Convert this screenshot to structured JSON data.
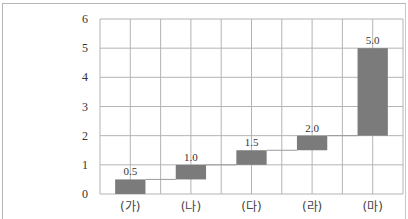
{
  "chart_data": {
    "type": "bar",
    "subtype": "waterfall",
    "title": "",
    "xlabel": "",
    "ylabel": "",
    "categories": [
      "(가)",
      "(나)",
      "(다)",
      "(라)",
      "(마)"
    ],
    "values": [
      0.5,
      1.0,
      1.5,
      2.0,
      5.0
    ],
    "bar_bottoms": [
      0,
      0.5,
      1.0,
      1.5,
      2.0
    ],
    "value_labels": [
      "0.5",
      "1.0",
      "1.5",
      "2.0",
      "5.0"
    ],
    "ylim": [
      0,
      6
    ],
    "yticks": [
      0,
      1,
      2,
      3,
      4,
      5,
      6
    ],
    "grid": true,
    "legend": null,
    "colors": {
      "bar": "#7b7b7b",
      "grid": "#b4b4b4",
      "connector": "#9a9a9a"
    }
  }
}
